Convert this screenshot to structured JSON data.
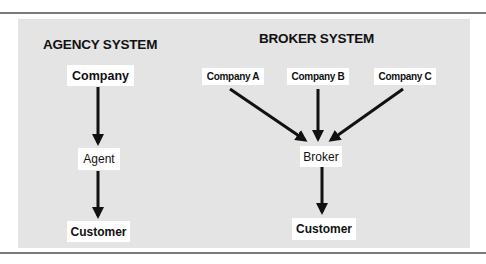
{
  "diagram": {
    "agency": {
      "title": "AGENCY SYSTEM",
      "nodes": {
        "company": "Company",
        "agent": "Agent",
        "customer": "Customer"
      },
      "edges": [
        {
          "from": "Company",
          "to": "Agent"
        },
        {
          "from": "Agent",
          "to": "Customer"
        }
      ]
    },
    "broker": {
      "title": "BROKER SYSTEM",
      "nodes": {
        "company_a": "Company A",
        "company_b": "Company B",
        "company_c": "Company C",
        "broker": "Broker",
        "customer": "Customer"
      },
      "edges": [
        {
          "from": "Company A",
          "to": "Broker"
        },
        {
          "from": "Company B",
          "to": "Broker"
        },
        {
          "from": "Company C",
          "to": "Broker"
        },
        {
          "from": "Broker",
          "to": "Customer"
        }
      ]
    },
    "colors": {
      "panel": "#e4e4e4",
      "node_bg": "#ffffff",
      "arrow": "#111111",
      "rule": "#7a7a7a"
    }
  }
}
